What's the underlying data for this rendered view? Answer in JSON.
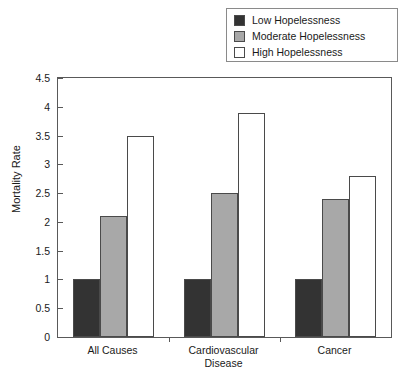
{
  "chart_data": {
    "type": "bar",
    "title": "",
    "xlabel": "",
    "ylabel": "Mortality Rate",
    "ylim": [
      0,
      4.5
    ],
    "yticks": [
      "0",
      "0.5",
      "1",
      "1.5",
      "2",
      "2.5",
      "3",
      "3.5",
      "4",
      "4.5"
    ],
    "ytick_values": [
      0,
      0.5,
      1,
      1.5,
      2,
      2.5,
      3,
      3.5,
      4,
      4.5
    ],
    "grid": false,
    "legend_position": "top-right",
    "categories": [
      "All Causes",
      "Cardiovascular Disease",
      "Cancer"
    ],
    "category_lines": [
      [
        "All Causes"
      ],
      [
        "Cardiovascular",
        "Disease"
      ],
      [
        "Cancer"
      ]
    ],
    "series": [
      {
        "name": "Low Hopelessness",
        "color": "#333333",
        "values": [
          1.0,
          1.0,
          1.0
        ]
      },
      {
        "name": "Moderate Hopelessness",
        "color": "#a8a8a8",
        "values": [
          2.1,
          2.5,
          2.4
        ]
      },
      {
        "name": "High Hopelessness",
        "color": "#ffffff",
        "values": [
          3.5,
          3.9,
          2.8
        ]
      }
    ]
  },
  "legend": {
    "items": [
      {
        "label": "Low Hopelessness",
        "color": "#333333"
      },
      {
        "label": "Moderate Hopelessness",
        "color": "#a8a8a8"
      },
      {
        "label": "High Hopelessness",
        "color": "#ffffff"
      }
    ]
  },
  "axes": {
    "y_title": "Mortality Rate"
  }
}
